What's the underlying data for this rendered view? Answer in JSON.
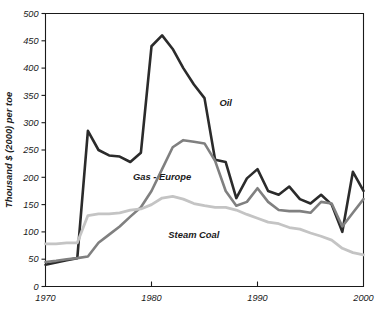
{
  "chart_data": {
    "type": "line",
    "title": "",
    "xlabel": "",
    "ylabel": "Thousand $ (2000) per toe",
    "xlim": [
      1970,
      2000
    ],
    "ylim": [
      0,
      500
    ],
    "yticks": [
      0,
      50,
      100,
      150,
      200,
      250,
      300,
      350,
      400,
      450,
      500
    ],
    "xticks": [
      1970,
      1980,
      1990,
      2000
    ],
    "xticklabels": [
      "1970",
      "1980",
      "1990",
      "2000"
    ],
    "yticklabels": [
      "0",
      "50",
      "100",
      "150",
      "200",
      "250",
      "300",
      "350",
      "400",
      "450",
      "500"
    ],
    "grid": false,
    "legend_position": "inline-annotations",
    "x": [
      1970,
      1971,
      1972,
      1973,
      1974,
      1975,
      1976,
      1977,
      1978,
      1979,
      1980,
      1981,
      1982,
      1983,
      1984,
      1985,
      1986,
      1987,
      1988,
      1989,
      1990,
      1991,
      1992,
      1993,
      1994,
      1995,
      1996,
      1997,
      1998,
      1999,
      2000
    ],
    "series": [
      {
        "name": "Oil",
        "color": "#2b2b2b",
        "label_x": 1987,
        "label_y": 330,
        "values": [
          40,
          44,
          48,
          52,
          285,
          250,
          240,
          238,
          228,
          245,
          440,
          460,
          435,
          400,
          370,
          345,
          232,
          228,
          162,
          198,
          215,
          175,
          168,
          183,
          160,
          152,
          168,
          150,
          100,
          210,
          175
        ]
      },
      {
        "name": "Gas - Europe",
        "color": "#808080",
        "label_x": 1981,
        "label_y": 195,
        "values": [
          45,
          47,
          50,
          52,
          55,
          80,
          95,
          110,
          128,
          145,
          175,
          215,
          255,
          268,
          265,
          262,
          230,
          175,
          148,
          155,
          180,
          155,
          140,
          138,
          138,
          135,
          155,
          152,
          110,
          135,
          160
        ]
      },
      {
        "name": "Steam Coal",
        "color": "#c4c4c4",
        "label_x": 1984,
        "label_y": 88,
        "values": [
          78,
          78,
          80,
          80,
          130,
          133,
          133,
          135,
          140,
          142,
          150,
          162,
          165,
          160,
          152,
          148,
          145,
          145,
          140,
          132,
          125,
          118,
          115,
          108,
          105,
          98,
          92,
          85,
          70,
          62,
          58
        ]
      }
    ]
  }
}
